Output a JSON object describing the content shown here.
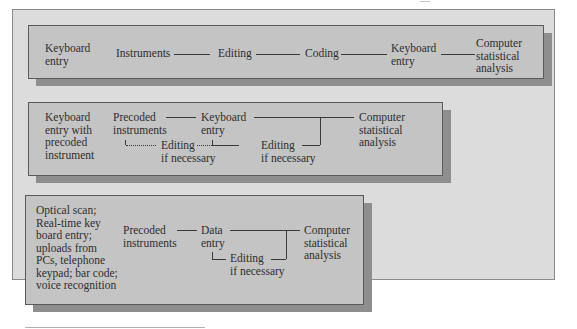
{
  "figure": {
    "rows": [
      {
        "method": "Keyboard entry",
        "steps": [
          "Instruments",
          "Editing",
          "Coding",
          "Keyboard entry",
          "Computer statistical analysis"
        ]
      },
      {
        "method": "Keyboard entry with precoded instrument",
        "steps": [
          "Precoded instruments",
          "Keyboard entry",
          "Editing if necessary",
          "Editing if necessary",
          "Computer statistical analysis"
        ]
      },
      {
        "method": "Optical scan; Real-time key board entry; uploads from PCs, telephone keypad; bar code; voice recognition",
        "steps": [
          "Precoded instruments",
          "Data entry",
          "Editing if necessary",
          "Computer statistical analysis"
        ]
      }
    ]
  },
  "row1": {
    "method": [
      "Keyboard",
      "entry"
    ],
    "instruments": "Instruments",
    "editing": "Editing",
    "coding": "Coding",
    "keyboard": [
      "Keyboard",
      "entry"
    ],
    "analysis": [
      "Computer",
      "statistical",
      "analysis"
    ]
  },
  "row2": {
    "method": [
      "Keyboard",
      "entry with",
      "precoded",
      "instrument"
    ],
    "precoded": [
      "Precoded",
      "instruments"
    ],
    "keyboard": [
      "Keyboard",
      "entry"
    ],
    "editing1": [
      "Editing",
      "if necessary"
    ],
    "editing2": [
      "Editing",
      "if necessary"
    ],
    "analysis": [
      "Computer",
      "statistical",
      "analysis"
    ]
  },
  "row3": {
    "method": [
      "Optical scan;",
      "Real-time key",
      "board entry;",
      "uploads from",
      "PCs, telephone",
      "keypad; bar code;",
      "voice recognition"
    ],
    "precoded": [
      "Precoded",
      "instruments"
    ],
    "data_entry": [
      "Data",
      "entry"
    ],
    "editing": [
      "Editing",
      "if necessary"
    ],
    "analysis": [
      "Computer",
      "statistical",
      "analysis"
    ]
  },
  "colors": {
    "panel": "#dcdcdc",
    "box": "#c4c4c4",
    "shadow": "#8e8e8e",
    "text": "#2e2e2e"
  }
}
